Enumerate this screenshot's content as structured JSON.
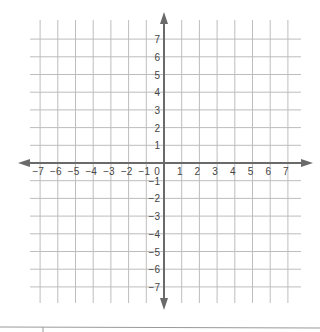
{
  "diagram": {
    "type": "coordinate-plane",
    "x_range": [
      -7,
      7
    ],
    "y_range": [
      -7,
      7
    ],
    "grid": true,
    "x_tick_labels": [
      "-7",
      "-6",
      "-5",
      "-4",
      "-3",
      "-2",
      "-1",
      "1",
      "2",
      "3",
      "4",
      "5",
      "6",
      "7"
    ],
    "y_tick_labels_positive": [
      "7",
      "6",
      "5",
      "4",
      "3",
      "2",
      "1"
    ],
    "y_tick_labels_negative": [
      "-1",
      "-2",
      "-3",
      "-4",
      "-5",
      "-6",
      "-7"
    ],
    "origin_label": "0",
    "colors": {
      "grid": "#bdbdbd",
      "axis": "#666666",
      "text": "#444444"
    }
  }
}
